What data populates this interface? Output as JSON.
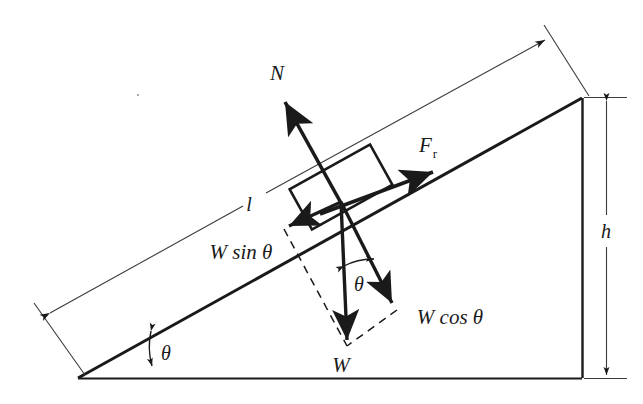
{
  "figure": {
    "type": "free-body-diagram",
    "background_color": "#ffffff",
    "stroke_color": "#1a1a1a",
    "width": 643,
    "height": 404
  },
  "labels": {
    "normal_force": "N",
    "friction_force": "F",
    "friction_force_subscript": "r",
    "weight": "W",
    "weight_parallel": "W sin θ",
    "weight_perpendicular": "W cos θ",
    "incline_length": "l",
    "height": "h",
    "incline_angle": "θ",
    "resolution_angle": "θ"
  },
  "geometry": {
    "base_vertex": [
      78,
      378
    ],
    "apex_vertex": [
      582,
      98
    ],
    "right_base_vertex": [
      582,
      378
    ],
    "block_center": [
      341,
      202
    ],
    "incline_angle_degrees": 29,
    "ground_line_y": 378,
    "vertical_side_x": 582,
    "height_dimension_x": 606,
    "height_dimension_top": 98,
    "height_dimension_bottom": 378
  },
  "vectors": [
    {
      "name": "normal-force",
      "label": "N",
      "from": [
        341,
        202
      ],
      "to": [
        283,
        98
      ],
      "style": "solid-bold"
    },
    {
      "name": "friction-force",
      "label": "F_r",
      "from": [
        324,
        212
      ],
      "to": [
        438,
        170
      ],
      "style": "solid-bold"
    },
    {
      "name": "weight",
      "label": "W",
      "from": [
        341,
        202
      ],
      "to": [
        348,
        345
      ],
      "style": "solid-bold"
    },
    {
      "name": "weight-parallel",
      "label": "W sin θ",
      "from": [
        341,
        202
      ],
      "to": [
        284,
        228
      ],
      "style": "solid-bold"
    },
    {
      "name": "weight-perpendicular",
      "label": "W cos θ",
      "from": [
        341,
        202
      ],
      "to": [
        397,
        309
      ],
      "style": "solid-bold"
    }
  ],
  "annotations": {
    "dashed_components": true,
    "angle_arcs": 2,
    "dimension_lines": [
      "incline-length-l",
      "height-h"
    ]
  }
}
